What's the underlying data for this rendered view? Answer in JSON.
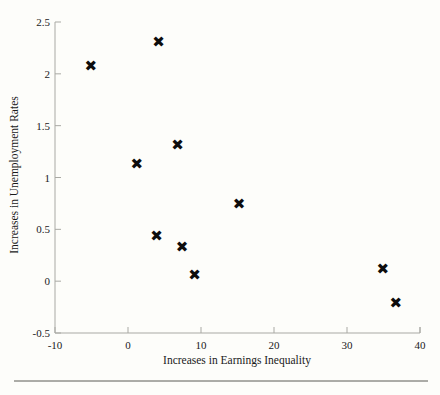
{
  "chart_data": {
    "type": "scatter",
    "title": "",
    "xlabel": "Increases in Earnings Inequality",
    "ylabel": "Increases in Unemployment Rates",
    "xlim": [
      -10,
      40
    ],
    "ylim": [
      -0.5,
      2.5
    ],
    "xticks": [
      -10,
      0,
      10,
      20,
      30,
      40
    ],
    "xtick_labels": [
      "-10",
      "0",
      "10",
      "20",
      "30",
      "40"
    ],
    "yticks": [
      -0.5,
      0,
      0.5,
      1,
      1.5,
      2,
      2.5
    ],
    "ytick_labels": [
      "-0.5",
      "0",
      "0.5",
      "1",
      "1.5",
      "2",
      "2.5"
    ],
    "grid": false,
    "legend": null,
    "marker": "x",
    "marker_color": "#0d0d0d",
    "background_color": "#fdfdfa",
    "axis_color": "#a9a9a4",
    "points": [
      {
        "x": -5.1,
        "y": 2.08
      },
      {
        "x": 4.2,
        "y": 2.31
      },
      {
        "x": 1.2,
        "y": 1.13
      },
      {
        "x": 6.8,
        "y": 1.32
      },
      {
        "x": 15.2,
        "y": 0.75
      },
      {
        "x": 3.9,
        "y": 0.44
      },
      {
        "x": 7.4,
        "y": 0.33
      },
      {
        "x": 9.1,
        "y": 0.06
      },
      {
        "x": 34.9,
        "y": 0.12
      },
      {
        "x": 36.7,
        "y": -0.21
      }
    ],
    "series": [
      {
        "name": "observations",
        "x": [
          -5.1,
          4.2,
          1.2,
          6.8,
          15.2,
          3.9,
          7.4,
          9.1,
          34.9,
          36.7
        ],
        "values": [
          2.08,
          2.31,
          1.13,
          1.32,
          0.75,
          0.44,
          0.33,
          0.06,
          0.12,
          -0.21
        ]
      }
    ]
  },
  "footer": {
    "rule_visible": true
  }
}
